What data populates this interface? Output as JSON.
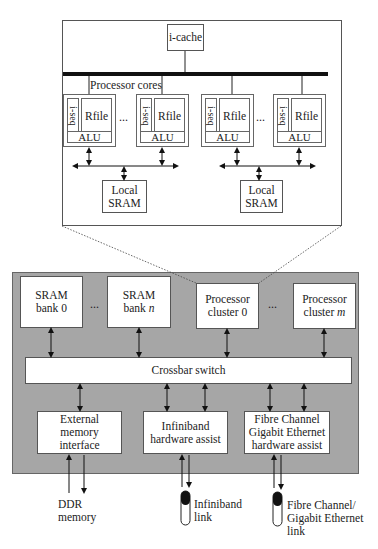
{
  "cluster_detail": {
    "icache_label": "i-cache",
    "bus_label": "Processor cores",
    "ellipsis": "...",
    "cores": [
      {
        "iseq": "i-seq",
        "rfile": "Rfile",
        "alu": "ALU"
      },
      {
        "iseq": "i-seq",
        "rfile": "Rfile",
        "alu": "ALU"
      },
      {
        "iseq": "i-seq",
        "rfile": "Rfile",
        "alu": "ALU"
      },
      {
        "iseq": "i-seq",
        "rfile": "Rfile",
        "alu": "ALU"
      }
    ],
    "local_srams": [
      {
        "line1": "Local",
        "line2": "SRAM"
      },
      {
        "line1": "Local",
        "line2": "SRAM"
      }
    ]
  },
  "chip": {
    "ellipsis": "...",
    "sram_banks": [
      {
        "line1": "SRAM",
        "line2": "bank 0"
      },
      {
        "line1": "SRAM",
        "line2": "bank ",
        "var": "n"
      }
    ],
    "processor_clusters": [
      {
        "line1": "Processor",
        "line2": "cluster 0"
      },
      {
        "line1": "Processor",
        "line2": "cluster ",
        "var": "m"
      }
    ],
    "crossbar_label": "Crossbar switch",
    "interfaces": [
      {
        "lines": [
          "External",
          "memory",
          "interface"
        ]
      },
      {
        "lines": [
          "Infiniband",
          "hardware assist"
        ]
      },
      {
        "lines": [
          "Fibre Channel",
          "Gigabit Ethernet",
          "hardware assist"
        ]
      }
    ]
  },
  "external": {
    "ddr": {
      "line1": "DDR",
      "line2": "memory"
    },
    "infiniband_link": {
      "line1": "Infiniband",
      "line2": "link"
    },
    "fibre_link": {
      "line1": "Fibre Channel/",
      "line2": "Gigabit Ethernet",
      "line3": "link"
    }
  },
  "colors": {
    "chip_background": "#a6a6a6",
    "box_fill": "#ffffff",
    "line": "#222222"
  }
}
